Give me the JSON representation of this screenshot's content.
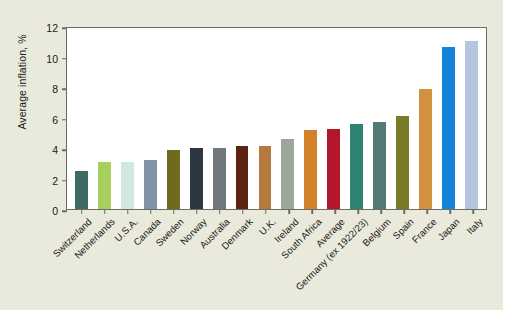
{
  "chart_data": {
    "type": "bar",
    "title": "",
    "xlabel": "",
    "ylabel": "Average inflation, %",
    "ylim": [
      0,
      12
    ],
    "yticks": [
      0,
      2,
      4,
      6,
      8,
      10,
      12
    ],
    "grid": false,
    "legend": "none",
    "categories": [
      "Switzerland",
      "Netherlands",
      "U.S.A.",
      "Canada",
      "Sweden",
      "Norway",
      "Australia",
      "Denmark",
      "U.K.",
      "Ireland",
      "South Africa",
      "Average",
      "Germany (ex 1922/23)",
      "Belgium",
      "Spain",
      "France",
      "Japan",
      "Italy"
    ],
    "values": [
      2.5,
      3.1,
      3.1,
      3.2,
      3.9,
      4.0,
      4.0,
      4.1,
      4.15,
      4.6,
      5.15,
      5.25,
      5.6,
      5.7,
      6.1,
      7.9,
      10.6,
      11.0
    ],
    "colors": [
      "#3d6b61",
      "#a7cf5c",
      "#cfe9df",
      "#7f93a5",
      "#6e6b1e",
      "#2d3742",
      "#70787e",
      "#5c2410",
      "#b4793e",
      "#9aa79b",
      "#d4822a",
      "#b4172b",
      "#2e8470",
      "#537b76",
      "#797b27",
      "#d0923f",
      "#1484d8",
      "#b4c6dd"
    ]
  },
  "axis": {
    "y_title": "Average inflation, %",
    "y_tick_labels": [
      "0",
      "2",
      "4",
      "6",
      "8",
      "10",
      "12"
    ]
  },
  "colors": {
    "page_background": "#e9e9dc",
    "plot_background": "#ffffff",
    "axis_line": "#6c6c66",
    "text": "#1b1b18"
  }
}
